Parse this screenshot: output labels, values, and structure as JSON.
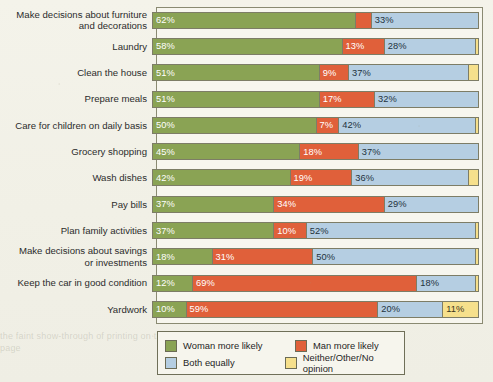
{
  "chart_data": {
    "type": "bar",
    "subtype": "stacked-horizontal-100",
    "title": "",
    "xlabel": "",
    "ylabel": "",
    "xlim": [
      0,
      100
    ],
    "grid": false,
    "legend_position": "bottom-left",
    "series": [
      {
        "name": "Woman more likely",
        "color": "#8aa354",
        "values": [
          62,
          58,
          51,
          51,
          50,
          45,
          42,
          37,
          37,
          18,
          12,
          10
        ]
      },
      {
        "name": "Man more likely",
        "color": "#e0603a",
        "values": [
          5,
          13,
          9,
          17,
          7,
          18,
          19,
          34,
          10,
          31,
          69,
          59
        ]
      },
      {
        "name": "Both equally",
        "color": "#b5cee2",
        "values": [
          33,
          28,
          37,
          32,
          42,
          37,
          36,
          29,
          52,
          50,
          18,
          20
        ]
      },
      {
        "name": "Neither/Other/No opinion",
        "color": "#f6e08c",
        "values": [
          0,
          1,
          3,
          0,
          1,
          0,
          3,
          0,
          1,
          1,
          1,
          11
        ]
      }
    ],
    "categories": [
      "Make decisions about furniture and decorations",
      "Laundry",
      "Clean the house",
      "Prepare meals",
      "Care for children on daily basis",
      "Grocery shopping",
      "Wash dishes",
      "Pay bills",
      "Plan family activities",
      "Make decisions about savings or investments",
      "Keep the car in good condition",
      "Yardwork"
    ]
  },
  "rows": [
    {
      "label": "Make decisions about furniture\nand decorations",
      "segments": [
        {
          "series": "woman",
          "value": 62,
          "label": "62%"
        },
        {
          "series": "man",
          "value": 5,
          "label": ""
        },
        {
          "series": "both",
          "value": 33,
          "label": "33%"
        }
      ]
    },
    {
      "label": "Laundry",
      "segments": [
        {
          "series": "woman",
          "value": 58,
          "label": "58%"
        },
        {
          "series": "man",
          "value": 13,
          "label": "13%"
        },
        {
          "series": "both",
          "value": 28,
          "label": "28%"
        },
        {
          "series": "other",
          "value": 1,
          "label": ""
        }
      ]
    },
    {
      "label": "Clean the house",
      "segments": [
        {
          "series": "woman",
          "value": 51,
          "label": "51%"
        },
        {
          "series": "man",
          "value": 9,
          "label": "9%"
        },
        {
          "series": "both",
          "value": 37,
          "label": "37%"
        },
        {
          "series": "other",
          "value": 3,
          "label": ""
        }
      ]
    },
    {
      "label": "Prepare meals",
      "segments": [
        {
          "series": "woman",
          "value": 51,
          "label": "51%"
        },
        {
          "series": "man",
          "value": 17,
          "label": "17%"
        },
        {
          "series": "both",
          "value": 32,
          "label": "32%"
        }
      ]
    },
    {
      "label": "Care for children on daily basis",
      "segments": [
        {
          "series": "woman",
          "value": 50,
          "label": "50%"
        },
        {
          "series": "man",
          "value": 7,
          "label": "7%"
        },
        {
          "series": "both",
          "value": 42,
          "label": "42%"
        },
        {
          "series": "other",
          "value": 1,
          "label": ""
        }
      ]
    },
    {
      "label": "Grocery shopping",
      "segments": [
        {
          "series": "woman",
          "value": 45,
          "label": "45%"
        },
        {
          "series": "man",
          "value": 18,
          "label": "18%"
        },
        {
          "series": "both",
          "value": 37,
          "label": "37%"
        }
      ]
    },
    {
      "label": "Wash dishes",
      "segments": [
        {
          "series": "woman",
          "value": 42,
          "label": "42%"
        },
        {
          "series": "man",
          "value": 19,
          "label": "19%"
        },
        {
          "series": "both",
          "value": 36,
          "label": "36%"
        },
        {
          "series": "other",
          "value": 3,
          "label": ""
        }
      ]
    },
    {
      "label": "Pay bills",
      "segments": [
        {
          "series": "woman",
          "value": 37,
          "label": "37%"
        },
        {
          "series": "man",
          "value": 34,
          "label": "34%"
        },
        {
          "series": "both",
          "value": 29,
          "label": "29%"
        }
      ]
    },
    {
      "label": "Plan family activities",
      "segments": [
        {
          "series": "woman",
          "value": 37,
          "label": "37%"
        },
        {
          "series": "man",
          "value": 10,
          "label": "10%"
        },
        {
          "series": "both",
          "value": 52,
          "label": "52%"
        },
        {
          "series": "other",
          "value": 1,
          "label": ""
        }
      ]
    },
    {
      "label": "Make decisions about savings\nor investments",
      "segments": [
        {
          "series": "woman",
          "value": 18,
          "label": "18%"
        },
        {
          "series": "man",
          "value": 31,
          "label": "31%"
        },
        {
          "series": "both",
          "value": 50,
          "label": "50%"
        },
        {
          "series": "other",
          "value": 1,
          "label": ""
        }
      ]
    },
    {
      "label": "Keep the car in good condition",
      "segments": [
        {
          "series": "woman",
          "value": 12,
          "label": "12%"
        },
        {
          "series": "man",
          "value": 69,
          "label": "69%"
        },
        {
          "series": "both",
          "value": 18,
          "label": "18%"
        },
        {
          "series": "other",
          "value": 1,
          "label": ""
        }
      ]
    },
    {
      "label": "Yardwork",
      "segments": [
        {
          "series": "woman",
          "value": 10,
          "label": "10%"
        },
        {
          "series": "man",
          "value": 59,
          "label": "59%"
        },
        {
          "series": "both",
          "value": 20,
          "label": "20%"
        },
        {
          "series": "other",
          "value": 11,
          "label": "11%"
        }
      ]
    }
  ],
  "legend": {
    "items": [
      {
        "key": "woman",
        "label": "Woman more likely",
        "color": "#8aa354"
      },
      {
        "key": "man",
        "label": "Man more likely",
        "color": "#e0603a"
      },
      {
        "key": "both",
        "label": "Both equally",
        "color": "#b5cee2"
      },
      {
        "key": "other",
        "label": "Neither/Other/No opinion",
        "color": "#f6e08c"
      }
    ]
  },
  "ghost_text": "the faint show-through of printing on the reverse of the page"
}
